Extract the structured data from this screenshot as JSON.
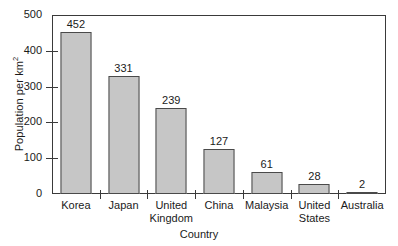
{
  "chart_data": {
    "type": "bar",
    "title": "",
    "xlabel": "Country",
    "ylabel": "Population per km2",
    "ylabel_base": "Population per km",
    "ylabel_sup": "2",
    "categories": [
      "Korea",
      "Japan",
      "United Kingdom",
      "China",
      "Malaysia",
      "United States",
      "Australia"
    ],
    "category_lines": [
      [
        "Korea"
      ],
      [
        "Japan"
      ],
      [
        "United",
        "Kingdom"
      ],
      [
        "China"
      ],
      [
        "Malaysia"
      ],
      [
        "United",
        "States"
      ],
      [
        "Australia"
      ]
    ],
    "values": [
      452,
      331,
      239,
      127,
      61,
      28,
      2
    ],
    "value_labels": [
      "452",
      "331",
      "239",
      "127",
      "61",
      "28",
      "2"
    ],
    "ylim": [
      0,
      500
    ],
    "yticks": [
      0,
      100,
      200,
      300,
      400,
      500
    ],
    "ytick_labels": [
      "0",
      "100",
      "200",
      "300",
      "400",
      "500"
    ],
    "grid": false,
    "legend": false,
    "bar_color": "#c6c6c6",
    "bar_edge_color": "#4a4a4a",
    "axis_color": "#3a3a3a",
    "background": "#ffffff"
  }
}
